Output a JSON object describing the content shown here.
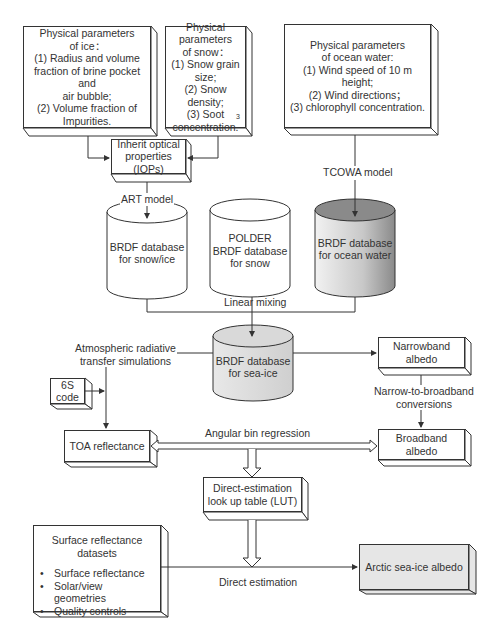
{
  "diagram": {
    "input_boxes": {
      "ice": {
        "lines": [
          "Physical parameters",
          "of ice：",
          "(1) Radius and volume",
          "fraction of brine pocket and",
          "air bubble;",
          "(2) Volume fraction of",
          "Impurities."
        ]
      },
      "snow": {
        "lines": [
          "Physical parameters",
          "of snow：",
          "(1) Snow grain size;",
          "(2) Snow density;",
          "(3) Soot",
          "concentration."
        ],
        "footnote": "3"
      },
      "ocean": {
        "lines": [
          "Physical parameters",
          "of ocean water:",
          "(1) Wind speed of 10 m",
          "height;",
          "(2) Wind directions；",
          "(3) chlorophyll concentration."
        ]
      }
    },
    "iops_box": {
      "lines": [
        "Inherit optical",
        "properties",
        "(IOPs)"
      ]
    },
    "model_labels": {
      "art": "ART model",
      "tcowa": "TCOWA model"
    },
    "databases": {
      "snow_ice": {
        "lines": [
          "BRDF database",
          "for snow/ice"
        ],
        "fill": "#ffffff"
      },
      "polder": {
        "lines": [
          "POLDER",
          "BRDF database",
          "for snow"
        ],
        "fill": "#ffffff"
      },
      "ocean": {
        "lines": [
          "BRDF database",
          "for ocean water"
        ],
        "fill": "#8a8a8a"
      },
      "sea_ice": {
        "lines": [
          "BRDF database",
          "for sea-ice"
        ],
        "fill": "#d6d6d6"
      }
    },
    "edge_labels": {
      "linear_mixing": "Linear mixing",
      "atm_rt": [
        "Atmospheric radiative",
        "transfer simulations"
      ],
      "narrow_to_broad": [
        "Narrow-to-broadband",
        "conversions"
      ],
      "angular_bin": "Angular bin regression",
      "direct_estimation": "Direct estimation"
    },
    "process_boxes": {
      "six_s": {
        "lines": [
          "6S",
          "code"
        ]
      },
      "narrowband": {
        "lines": [
          "Narrowband",
          "albedo"
        ]
      },
      "toa": {
        "lines": [
          "TOA reflectance"
        ]
      },
      "broadband": {
        "lines": [
          "Broadband",
          "albedo"
        ]
      },
      "lut": {
        "lines": [
          "Direct-estimation",
          "look up table (LUT)"
        ]
      },
      "surface": {
        "lines": [
          "Surface reflectance",
          "datasets"
        ],
        "bullets": [
          "Surface reflectance",
          "Solar/view geometries",
          "Quality controls"
        ]
      },
      "output": {
        "lines": [
          "Arctic sea-ice albedo"
        ],
        "fill": "#e6e6e6"
      }
    },
    "colors": {
      "stroke": "#333333",
      "text": "#333333",
      "shadow": "#ffffff"
    }
  }
}
